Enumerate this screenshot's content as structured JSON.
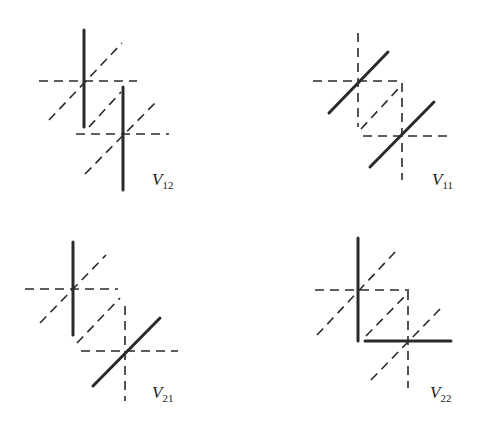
{
  "figure": {
    "panels": [
      {
        "id": "V12",
        "label": "V",
        "subscript": "12",
        "label_pos": [
          152,
          170
        ],
        "solid": [
          [
            84,
            30,
            84,
            127
          ],
          [
            123,
            87,
            123,
            190
          ]
        ],
        "dashed": [
          [
            39,
            81,
            137,
            81
          ],
          [
            49,
            120,
            122,
            43
          ],
          [
            89,
            127,
            121,
            92
          ],
          [
            76,
            134,
            169,
            134
          ],
          [
            85,
            174,
            158,
            100
          ]
        ]
      },
      {
        "id": "V11",
        "label": "V",
        "subscript": "11",
        "label_pos": [
          432,
          170
        ],
        "solid": [
          [
            329,
            113,
            388,
            52
          ],
          [
            370,
            167,
            434,
            102
          ]
        ],
        "dashed": [
          [
            358,
            33,
            358,
            127
          ],
          [
            313,
            81,
            403,
            81
          ],
          [
            402,
            83,
            402,
            180
          ],
          [
            363,
            136,
            453,
            136
          ],
          [
            361,
            129,
            399,
            88
          ]
        ]
      },
      {
        "id": "V21",
        "label": "V",
        "subscript": "21",
        "label_pos": [
          152,
          383
        ],
        "solid": [
          [
            73,
            242,
            73,
            335
          ],
          [
            93,
            386,
            160,
            318
          ]
        ],
        "dashed": [
          [
            25,
            289,
            118,
            289
          ],
          [
            40,
            323,
            106,
            255
          ],
          [
            77,
            343,
            120,
            298
          ],
          [
            125,
            306,
            125,
            401
          ],
          [
            81,
            351,
            178,
            351
          ]
        ]
      },
      {
        "id": "V22",
        "label": "V",
        "subscript": "22",
        "label_pos": [
          430,
          383
        ],
        "solid": [
          [
            358,
            238,
            358,
            341
          ],
          [
            365,
            341,
            451,
            341
          ]
        ],
        "dashed": [
          [
            315,
            290,
            409,
            290
          ],
          [
            317,
            335,
            397,
            250
          ],
          [
            366,
            336,
            406,
            295
          ],
          [
            408,
            291,
            408,
            388
          ],
          [
            371,
            380,
            441,
            308
          ]
        ]
      }
    ]
  }
}
